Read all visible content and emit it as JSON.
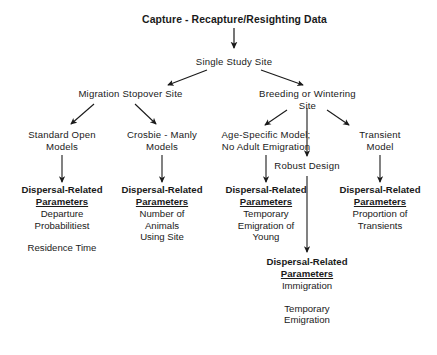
{
  "diagram": {
    "title": "Capture - Recapture/Resighting  Data",
    "line_color": "#1a1a1a",
    "background_color": "#ffffff",
    "text_color": "#1a1a1a",
    "nodes": {
      "root": "Capture - Recapture/Resighting  Data",
      "single_study_site": "Single Study Site",
      "migration_stopover_site": "Migration Stopover Site",
      "breeding_or_wintering_site": "Breeding or Wintering\nSite",
      "standard_open_models": "Standard Open\nModels",
      "crosbie_manly_models": "Crosbie - Manly\nModels",
      "age_specific_model": "Age-Specific Model;\nNo Adult Emigration",
      "transient_model": "Transient\nModel",
      "robust_design": "Robust Design"
    },
    "parameter_blocks": [
      {
        "id": "standard-open-models-parameters",
        "head_line1": "Dispersal-Related",
        "head_line2": "Parameters",
        "items": "Departure\nProbabilitiest",
        "extra": "Residence Time"
      },
      {
        "id": "crosbie-manly-parameters",
        "head_line1": "Dispersal-Related",
        "head_line2": "Parameters",
        "items": "Number of\nAnimals\nUsing Site",
        "extra": ""
      },
      {
        "id": "age-specific-parameters",
        "head_line1": "Dispersal-Related",
        "head_line2": "Parameters",
        "items": "Temporary\nEmigration of\nYoung",
        "extra": ""
      },
      {
        "id": "transient-model-parameters",
        "head_line1": "Dispersal-Related",
        "head_line2": "Parameters",
        "items": "Proportion of\nTransients",
        "extra": ""
      },
      {
        "id": "robust-design-parameters",
        "head_line1": "Dispersal-Related",
        "head_line2": "Parameters",
        "items": "Immigration",
        "extra": "Temporary\nEmigration"
      }
    ]
  }
}
